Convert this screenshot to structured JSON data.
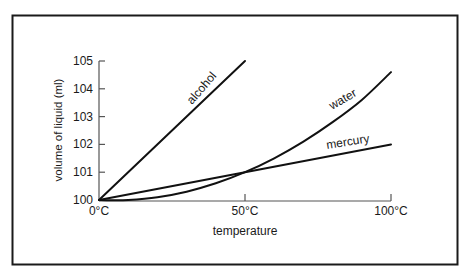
{
  "chart_data": {
    "type": "line",
    "title": "",
    "xlabel": "temperature",
    "ylabel": "volume of liquid (ml)",
    "xlim": [
      0,
      100
    ],
    "ylim": [
      100,
      105
    ],
    "x_ticks": [
      0,
      50,
      100
    ],
    "x_tick_labels": [
      "0°C",
      "50°C",
      "100°C"
    ],
    "y_ticks": [
      100,
      101,
      102,
      103,
      104,
      105
    ],
    "y_tick_labels": [
      "100",
      "101",
      "102",
      "103",
      "104",
      "105"
    ],
    "grid": false,
    "legend": "inline labels on curves",
    "series": [
      {
        "name": "alcohol",
        "x": [
          0,
          50
        ],
        "y": [
          100,
          105
        ]
      },
      {
        "name": "water",
        "x": [
          0,
          4,
          10,
          20,
          30,
          40,
          50,
          60,
          70,
          80,
          90,
          100
        ],
        "y": [
          100,
          99.99,
          100.0,
          100.1,
          100.3,
          100.6,
          101.0,
          101.5,
          102.1,
          102.8,
          103.6,
          104.6
        ]
      },
      {
        "name": "mercury",
        "x": [
          0,
          50,
          100
        ],
        "y": [
          100,
          101,
          102
        ]
      }
    ]
  },
  "labels": {
    "alcohol": "alcohol",
    "water": "water",
    "mercury": "mercury",
    "xlabel": "temperature",
    "ylabel": "volume of liquid (ml)"
  }
}
